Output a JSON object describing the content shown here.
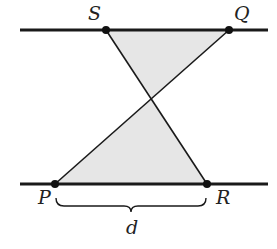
{
  "diagram": {
    "type": "geometry",
    "colors": {
      "line": "#1a1a1a",
      "shade": "#e6e6e6",
      "point": "#111111",
      "label": "#222222"
    },
    "lines": {
      "top": {
        "x1": 20,
        "y1": 30,
        "x2": 268,
        "y2": 30
      },
      "bottom": {
        "x1": 20,
        "y1": 184,
        "x2": 268,
        "y2": 184
      }
    },
    "points": {
      "S": {
        "x": 106,
        "y": 30,
        "label": "S"
      },
      "Q": {
        "x": 229,
        "y": 30,
        "label": "Q"
      },
      "P": {
        "x": 55,
        "y": 184,
        "label": "P"
      },
      "R": {
        "x": 207,
        "y": 184,
        "label": "R"
      },
      "X": {
        "x": 152,
        "y": 98
      }
    },
    "segments": [
      {
        "from": "S",
        "to": "R"
      },
      {
        "from": "Q",
        "to": "P"
      }
    ],
    "shaded_triangles": [
      [
        "S",
        "Q",
        "X"
      ],
      [
        "P",
        "R",
        "X"
      ]
    ],
    "brace": {
      "from": "P",
      "to": "R",
      "label": "d"
    }
  }
}
